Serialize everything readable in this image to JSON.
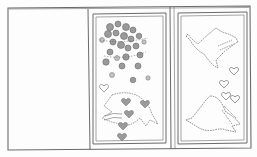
{
  "image": {
    "kind": "pencil-sketch",
    "subject": "tri-fold card layout with dove and heart motifs",
    "panels": [
      {
        "id": "left",
        "content": "blank"
      },
      {
        "id": "middle",
        "content": "dove filled with shaded hearts and dots"
      },
      {
        "id": "right",
        "content": "two outlined doves with small hearts"
      }
    ],
    "colors": {
      "paper": "#fdfdfd",
      "line": "#6a6a6a",
      "shade": "#9a9a9a",
      "light_shade": "#c4c4c4"
    }
  }
}
